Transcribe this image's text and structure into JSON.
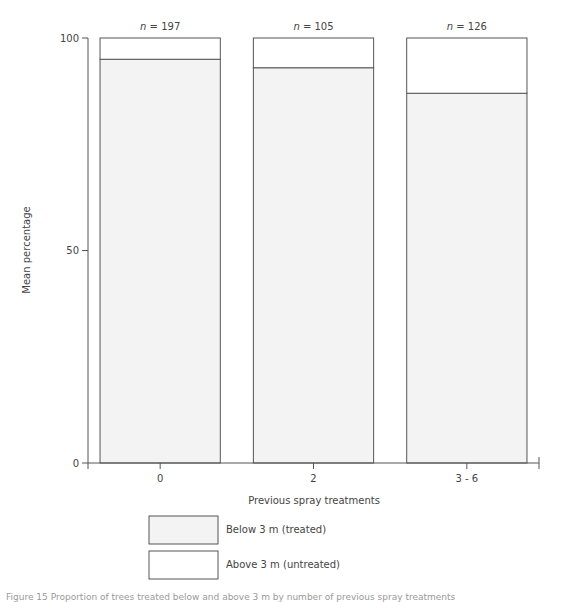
{
  "chart_data": {
    "type": "bar",
    "stacked": true,
    "title": "",
    "xlabel": "Previous spray treatments",
    "ylabel": "Mean percentage",
    "ylim": [
      0,
      100
    ],
    "yticks": [
      0,
      50,
      100
    ],
    "categories": [
      "0",
      "2",
      "3 - 6"
    ],
    "sample_sizes": [
      "n = 197",
      "n = 105",
      "n = 126"
    ],
    "series": [
      {
        "name": "Below 3 m (treated)",
        "values": [
          95,
          93,
          87
        ],
        "color": "#f3f3f3"
      },
      {
        "name": "Above 3 m (untreated)",
        "values": [
          5,
          7,
          13
        ],
        "color": "#ffffff"
      }
    ],
    "grid": false,
    "legend_position": "bottom"
  },
  "caption": "Figure 15  Proportion of trees treated below and above 3 m by number of previous spray treatments"
}
